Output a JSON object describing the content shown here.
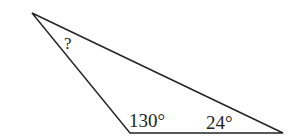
{
  "diagram": {
    "type": "triangle",
    "vertices": {
      "top": [
        32,
        13
      ],
      "bottom_left": [
        130,
        133
      ],
      "bottom_right": [
        283,
        133
      ]
    },
    "labels": {
      "unknown_angle": "?",
      "obtuse_angle": "130°",
      "acute_angle": "24°"
    },
    "stroke_color": "#222222"
  }
}
